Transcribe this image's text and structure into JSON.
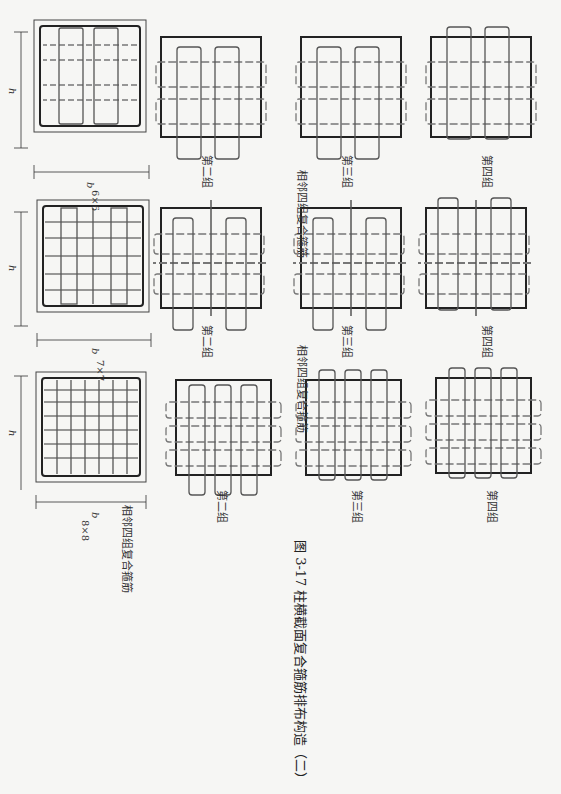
{
  "figure": {
    "caption": "图 3-17   柱横截面复合箍筋排布构造（二）"
  },
  "rows": [
    {
      "size_label": "6×6",
      "dim_b": "b",
      "dim_h": "h",
      "row_caption": "相邻四组复合箍筋",
      "groups": [
        "第一组",
        "第二组",
        "第三组",
        "第四组"
      ]
    },
    {
      "size_label": "7×7",
      "dim_b": "b",
      "dim_h": "h",
      "row_caption": "相邻四组复合箍筋",
      "groups": [
        "第一组",
        "第二组",
        "第三组",
        "第四组"
      ]
    },
    {
      "size_label": "8×8",
      "dim_b": "b",
      "dim_h": "h",
      "row_caption": "相邻四组复合箍筋",
      "groups": [
        "第一组",
        "第二组",
        "第三组",
        "第四组"
      ]
    }
  ],
  "colors": {
    "ink": "#222222",
    "stirrup": "#555555",
    "paper": "#f6f6f4"
  }
}
